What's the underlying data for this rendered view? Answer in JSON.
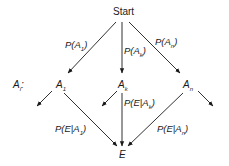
{
  "diagram": {
    "type": "probability-tree",
    "root": "Start",
    "level_label": "A_i:",
    "nodes": {
      "root": "Start",
      "a1": "A",
      "a1_sub": "1",
      "ak": "A",
      "ak_sub": "k",
      "an": "A",
      "an_sub": "n",
      "event": "E",
      "level_main": "A",
      "level_sub": "i",
      "level_colon": ":"
    },
    "edges": {
      "start_a1": {
        "pre": "P(A",
        "sub": "1",
        "post": ")"
      },
      "start_ak": {
        "pre": "P(A",
        "sub": "k",
        "post": ")"
      },
      "start_an": {
        "pre": "P(A",
        "sub": "n",
        "post": ")"
      },
      "a1_e": {
        "pre": "P(E|A",
        "sub": "1",
        "post": ")"
      },
      "ak_e": {
        "pre": "P(E|A",
        "sub": "k",
        "post": ")"
      },
      "an_e": {
        "pre": "P(E|A",
        "sub": "n",
        "post": ")"
      }
    }
  }
}
